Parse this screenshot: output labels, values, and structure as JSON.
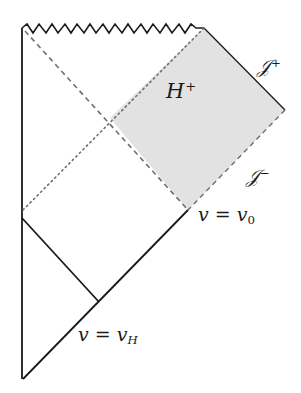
{
  "figure": {
    "type": "penrose-diagram",
    "colors": {
      "line": "#1a1a1a",
      "dashed": "#6e6e6e",
      "shaded_region": "#e2e2e2",
      "background": "#ffffff"
    }
  },
  "labels": {
    "horizon": {
      "base": "H",
      "sup": "+"
    },
    "scri_plus": {
      "base": "𝒥",
      "sup": "+"
    },
    "scri_minus": {
      "base": "𝒥",
      "sup": "−"
    },
    "v0": {
      "lhs": "v",
      "eq": " = ",
      "rhs": "v",
      "sub": "0"
    },
    "vH": {
      "lhs": "v",
      "eq": " = ",
      "rhs": "v",
      "sub": "H"
    }
  }
}
